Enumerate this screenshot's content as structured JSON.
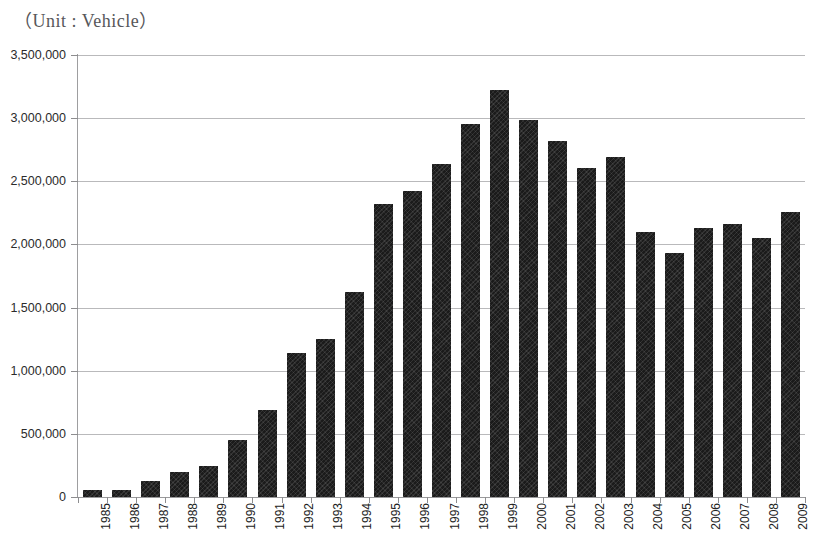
{
  "title": "（Unit : Vehicle）",
  "chart_data": {
    "type": "bar",
    "title": "（Unit : Vehicle）",
    "xlabel": "",
    "ylabel": "",
    "unit": "Vehicle",
    "ylim": [
      0,
      3500000
    ],
    "ytick_step": 500000,
    "grid": true,
    "legend": "none",
    "bar_color": "#1b1b1b",
    "categories": [
      "1985",
      "1986",
      "1987",
      "1988",
      "1989",
      "1990",
      "1991",
      "1992",
      "1993",
      "1994",
      "1995",
      "1996",
      "1997",
      "1998",
      "1999",
      "2000",
      "2001",
      "2002",
      "2003",
      "2004",
      "2005",
      "2006",
      "2007",
      "2008",
      "2009"
    ],
    "values": [
      55000,
      57000,
      130000,
      200000,
      245000,
      450000,
      690000,
      1140000,
      1255000,
      1625000,
      2320000,
      2420000,
      2640000,
      2950000,
      3220000,
      2985000,
      2820000,
      2605000,
      2690000,
      2100000,
      1930000,
      2130000,
      2160000,
      2050000,
      2260000
    ],
    "ytick_labels": [
      "0",
      "500,000",
      "1,000,000",
      "1,500,000",
      "2,000,000",
      "2,500,000",
      "3,000,000",
      "3,500,000"
    ],
    "ytick_values": [
      0,
      500000,
      1000000,
      1500000,
      2000000,
      2500000,
      3000000,
      3500000
    ]
  }
}
